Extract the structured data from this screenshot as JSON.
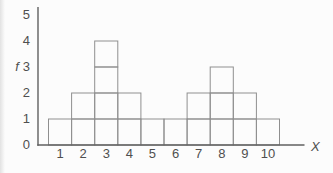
{
  "chart_data": {
    "type": "bar",
    "subtype": "unit-block-histogram",
    "title": "",
    "categories": [
      "1",
      "2",
      "3",
      "4",
      "5",
      "6",
      "7",
      "8",
      "9",
      "10"
    ],
    "values": [
      1,
      2,
      4,
      2,
      1,
      1,
      2,
      3,
      2,
      1
    ],
    "xlabel": "X",
    "ylabel": "f",
    "ylim": [
      0,
      5
    ],
    "yticks": [
      "0",
      "1",
      "2",
      "3",
      "4",
      "5"
    ],
    "grid": false,
    "legend": false,
    "colors": {
      "block_line": "#8f8f8f",
      "axis_line": "#606060",
      "text": "#4f4f4f",
      "background": "#fcfcfc"
    }
  }
}
